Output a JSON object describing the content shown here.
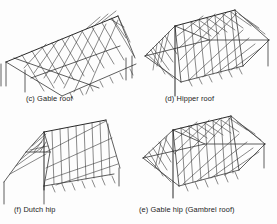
{
  "figure": {
    "kind": "technical-line-drawing",
    "background_color": "#fdfdfd",
    "line_color": "#2a2a2a",
    "panels": [
      {
        "key": "c",
        "label": "(c) Gable roof",
        "position": "top-left",
        "description": "Single ridge with parallel common rafters on both slopes, gable end wall, supporting posts at left"
      },
      {
        "key": "d",
        "label": "(d) Hipper roof",
        "position": "top-right",
        "description": "Trapezoidal plan, central ridge with four hip rafters running to the corners, jack rafters between"
      },
      {
        "key": "f",
        "label": "(f) Dutch hip",
        "position": "bottom-left",
        "description": "Gable end combined with a small hip at the top of the end wall, parallel rafters along the slope"
      },
      {
        "key": "e",
        "label": "(e) Gable hip (Gambrel roof)",
        "position": "bottom-right",
        "description": "Hipped plan with gambrel double-pitch slopes, ridge with hip rafters and crossing jack rafters"
      }
    ]
  }
}
